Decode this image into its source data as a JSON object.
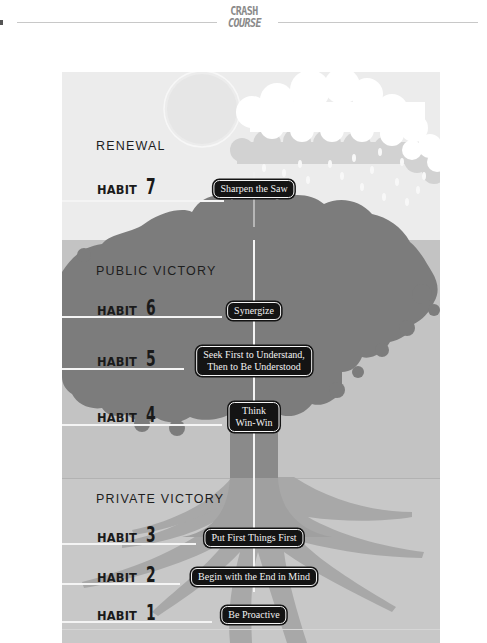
{
  "header": {
    "logo_line1": "CRASH",
    "logo_line2": "COURSE"
  },
  "colors": {
    "renewal_bg": "#ececec",
    "public_bg": "#c3c3c3",
    "private_bg": "#c8c8c8",
    "tree": "#7a7a7a",
    "roots": "#a0a0a0",
    "badge_bg": "#141414",
    "badge_text": "#f2f2f2"
  },
  "sections": {
    "renewal": {
      "title": "RENEWAL"
    },
    "public": {
      "title": "PUBLIC VICTORY"
    },
    "private": {
      "title": "PRIVATE VICTORY"
    }
  },
  "habits": [
    {
      "word": "HABIT",
      "number": "7",
      "name": "Sharpen the Saw"
    },
    {
      "word": "HABIT",
      "number": "6",
      "name": "Synergize"
    },
    {
      "word": "HABIT",
      "number": "5",
      "name_line1": "Seek First to Understand,",
      "name_line2": "Then to Be Understood"
    },
    {
      "word": "HABIT",
      "number": "4",
      "name_line1": "Think",
      "name_line2": "Win-Win"
    },
    {
      "word": "HABIT",
      "number": "3",
      "name": "Put First Things First"
    },
    {
      "word": "HABIT",
      "number": "2",
      "name": "Begin with the End in Mind"
    },
    {
      "word": "HABIT",
      "number": "1",
      "name": "Be Proactive"
    }
  ]
}
